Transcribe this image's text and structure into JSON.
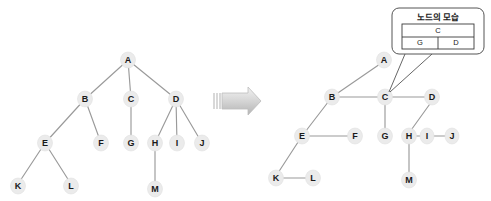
{
  "figure": {
    "background_color": "#ffffff",
    "node_fill_color": "#ebebeb",
    "edge_color": "#9a9a9a",
    "arrow_color": "#c9c9c9",
    "callout_stroke_color": "#555555",
    "left_tree": {
      "caption": "general tree",
      "nodes": [
        {
          "id": "A",
          "label": "A",
          "x": 128,
          "y": 60
        },
        {
          "id": "B",
          "label": "B",
          "x": 85,
          "y": 99
        },
        {
          "id": "C",
          "label": "C",
          "x": 131,
          "y": 99
        },
        {
          "id": "D",
          "label": "D",
          "x": 176,
          "y": 99
        },
        {
          "id": "E",
          "label": "E",
          "x": 45,
          "y": 143
        },
        {
          "id": "F",
          "label": "F",
          "x": 101,
          "y": 143
        },
        {
          "id": "G",
          "label": "G",
          "x": 131,
          "y": 143
        },
        {
          "id": "H",
          "label": "H",
          "x": 155,
          "y": 143
        },
        {
          "id": "I",
          "label": "I",
          "x": 177,
          "y": 143
        },
        {
          "id": "J",
          "label": "J",
          "x": 202,
          "y": 143
        },
        {
          "id": "K",
          "label": "K",
          "x": 18,
          "y": 186
        },
        {
          "id": "L",
          "label": "L",
          "x": 71,
          "y": 186
        },
        {
          "id": "M",
          "label": "M",
          "x": 155,
          "y": 189
        }
      ],
      "edges": [
        {
          "from": "A",
          "to": "B"
        },
        {
          "from": "A",
          "to": "C"
        },
        {
          "from": "A",
          "to": "D"
        },
        {
          "from": "B",
          "to": "E"
        },
        {
          "from": "B",
          "to": "F"
        },
        {
          "from": "C",
          "to": "G"
        },
        {
          "from": "D",
          "to": "H"
        },
        {
          "from": "D",
          "to": "I"
        },
        {
          "from": "D",
          "to": "J"
        },
        {
          "from": "E",
          "to": "K"
        },
        {
          "from": "E",
          "to": "L"
        },
        {
          "from": "H",
          "to": "M"
        }
      ]
    },
    "arrow": {
      "x": 213,
      "y": 88,
      "width": 48,
      "height": 28
    },
    "right_tree": {
      "caption": "left-child right-sibling representation",
      "nodes": [
        {
          "id": "A",
          "label": "A",
          "x": 384,
          "y": 60
        },
        {
          "id": "B",
          "label": "B",
          "x": 332,
          "y": 97
        },
        {
          "id": "C",
          "label": "C",
          "x": 385,
          "y": 97
        },
        {
          "id": "D",
          "label": "D",
          "x": 432,
          "y": 97
        },
        {
          "id": "E",
          "label": "E",
          "x": 302,
          "y": 136
        },
        {
          "id": "F",
          "label": "F",
          "x": 355,
          "y": 136
        },
        {
          "id": "G",
          "label": "G",
          "x": 385,
          "y": 136
        },
        {
          "id": "H",
          "label": "H",
          "x": 409,
          "y": 136
        },
        {
          "id": "I",
          "label": "I",
          "x": 427,
          "y": 136
        },
        {
          "id": "J",
          "label": "J",
          "x": 452,
          "y": 136
        },
        {
          "id": "K",
          "label": "K",
          "x": 276,
          "y": 178
        },
        {
          "id": "L",
          "label": "L",
          "x": 313,
          "y": 178
        },
        {
          "id": "M",
          "label": "M",
          "x": 409,
          "y": 180
        }
      ],
      "edges": [
        {
          "from": "A",
          "to": "B"
        },
        {
          "from": "B",
          "to": "C"
        },
        {
          "from": "C",
          "to": "D"
        },
        {
          "from": "B",
          "to": "E"
        },
        {
          "from": "E",
          "to": "F"
        },
        {
          "from": "C",
          "to": "G"
        },
        {
          "from": "D",
          "to": "H"
        },
        {
          "from": "H",
          "to": "I"
        },
        {
          "from": "I",
          "to": "J"
        },
        {
          "from": "E",
          "to": "K"
        },
        {
          "from": "K",
          "to": "L"
        },
        {
          "from": "H",
          "to": "M"
        }
      ]
    },
    "callout": {
      "title": "노드의 모습",
      "box": {
        "x": 392,
        "y": 8,
        "width": 92,
        "height": 46
      },
      "table": {
        "top_cell": "C",
        "bottom_left_cell": "G",
        "bottom_right_cell": "D"
      },
      "pointer_target": {
        "x": 385,
        "y": 97
      }
    }
  }
}
